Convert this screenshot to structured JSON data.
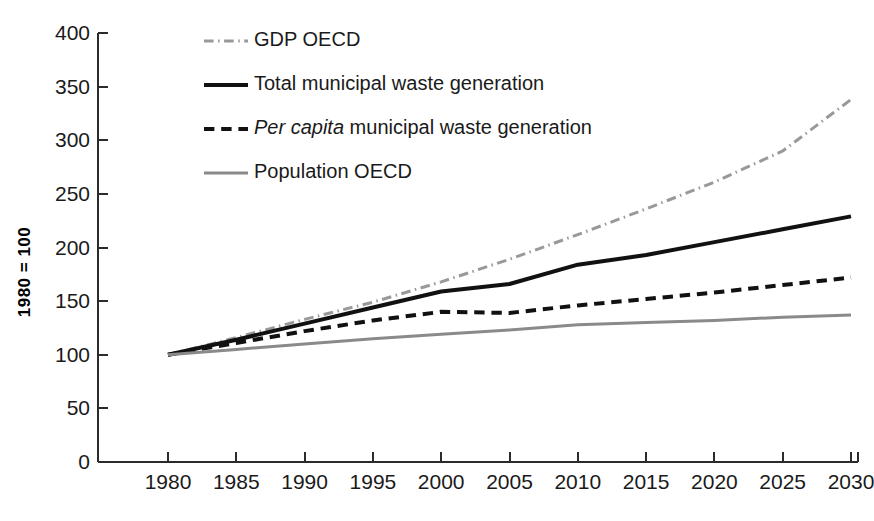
{
  "chart_data": {
    "type": "line",
    "title": "",
    "subtitle": "",
    "xlabel": "",
    "ylabel": "1980 = 100",
    "xlim": [
      1980,
      2030
    ],
    "ylim": [
      0,
      400
    ],
    "grid": false,
    "legend_position": "top-left-inside",
    "x": [
      1980,
      1985,
      1990,
      1995,
      2000,
      2005,
      2010,
      2015,
      2020,
      2025,
      2030
    ],
    "xtick_labels": [
      "1980",
      "1985",
      "1990",
      "1995",
      "2000",
      "2005",
      "2010",
      "2015",
      "2020",
      "2025",
      "2030"
    ],
    "ytick_labels": [
      "0",
      "50",
      "100",
      "150",
      "200",
      "250",
      "300",
      "350",
      "400"
    ],
    "ytick_values": [
      0,
      50,
      100,
      150,
      200,
      250,
      300,
      350,
      400
    ],
    "series": [
      {
        "name": "GDP OECD",
        "style": "dash-dot",
        "color": "#999999",
        "width": 3,
        "values": [
          100,
          116,
          133,
          149,
          168,
          189,
          212,
          236,
          261,
          290,
          338
        ]
      },
      {
        "name": "Total municipal waste generation",
        "style": "solid",
        "color": "#111111",
        "width": 4,
        "values": [
          100,
          114,
          129,
          144,
          159,
          166,
          184,
          193,
          205,
          217,
          229
        ]
      },
      {
        "name": "Per capita municipal waste generation",
        "style": "dashed",
        "color": "#111111",
        "width": 4,
        "values": [
          100,
          111,
          122,
          132,
          140,
          139,
          146,
          152,
          158,
          165,
          172
        ]
      },
      {
        "name": "Population OECD",
        "style": "solid",
        "color": "#8a8a8a",
        "width": 3,
        "values": [
          100,
          105,
          110,
          115,
          119,
          123,
          128,
          130,
          132,
          135,
          137
        ]
      }
    ]
  },
  "legend": {
    "items": [
      {
        "label": "GDP OECD",
        "italic_prefix": "",
        "style": "dash-dot",
        "color": "#999999",
        "width": 3
      },
      {
        "label": "Total municipal waste generation",
        "italic_prefix": "",
        "style": "solid",
        "color": "#111111",
        "width": 4
      },
      {
        "label": " municipal waste generation",
        "italic_prefix": "Per capita",
        "style": "dashed",
        "color": "#111111",
        "width": 4
      },
      {
        "label": "Population OECD",
        "italic_prefix": "",
        "style": "solid",
        "color": "#8a8a8a",
        "width": 3
      }
    ]
  },
  "axes": {
    "y_title": "1980 = 100"
  }
}
